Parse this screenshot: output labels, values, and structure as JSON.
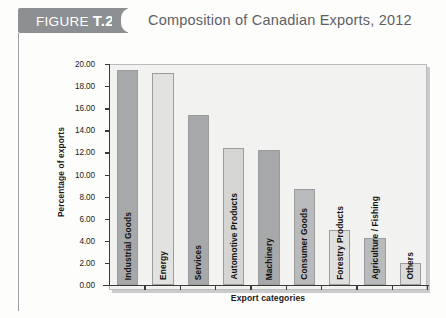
{
  "figure": {
    "badge_prefix": "FIGURE ",
    "badge_number": "T.2",
    "title": "Composition of Canadian Exports, 2012",
    "badge_color": "#8d9092",
    "title_color": "#5d6164"
  },
  "chart_data": {
    "type": "bar",
    "title": "Composition of Canadian Exports, 2012",
    "xlabel": "Export categories",
    "ylabel": "Percentage of exports",
    "ylim": [
      0,
      20
    ],
    "ytick_step": 2,
    "ytick_labels": [
      "0.00",
      "2.00",
      "4.00",
      "6.00",
      "8.00",
      "10.00",
      "12.00",
      "14.00",
      "16.00",
      "18.00",
      "20.00"
    ],
    "grid": false,
    "legend": null,
    "categories": [
      "Industrial Goods",
      "Energy",
      "Services",
      "Automotive Products",
      "Machinery",
      "Consumer Goods",
      "Forestry Products",
      "Agriculture / Fishing",
      "Others"
    ],
    "values": [
      19.45,
      19.2,
      15.35,
      12.4,
      12.2,
      8.65,
      4.95,
      4.3,
      1.95
    ],
    "bar_colors": [
      "#a6a8a9",
      "#e2e2e0",
      "#a6a8a9",
      "#d5d6d4",
      "#a6a8a9",
      "#b9babb",
      "#e0e0de",
      "#b9babb",
      "#dcdcda"
    ]
  },
  "page_caption": ""
}
